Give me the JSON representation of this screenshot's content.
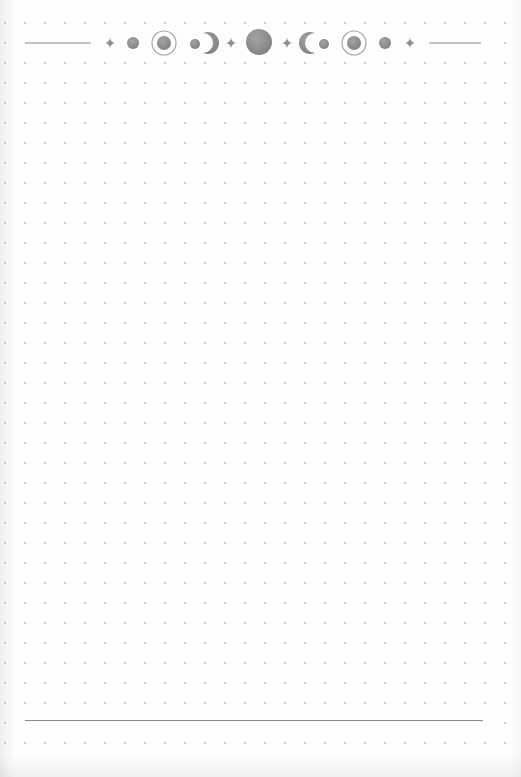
{
  "page": {
    "type": "dot-grid-journal-page",
    "background": "#fdfdfc",
    "dot_color": "#b8b8b8",
    "line_color": "#8a8a8a",
    "icon_color": "#8f8f8f",
    "grid": {
      "spacing_px": 20,
      "origin_x": 5,
      "origin_y": 3,
      "columns": 26,
      "rows": 38
    }
  },
  "header": {
    "line_left": {
      "x1": 25,
      "x2": 91,
      "y": 43
    },
    "line_right": {
      "x1": 429,
      "x2": 481,
      "y": 43
    },
    "icons": [
      {
        "name": "sparkle-icon",
        "x": 110,
        "y": 43,
        "size": 5
      },
      {
        "name": "new-moon-small-icon",
        "x": 133,
        "y": 43,
        "r": 6
      },
      {
        "name": "ringed-moon-icon",
        "x": 164,
        "y": 43,
        "r": 7,
        "ring_r": 12
      },
      {
        "name": "waxing-moon-dot-icon",
        "x": 195,
        "y": 44,
        "r": 5
      },
      {
        "name": "waxing-crescent-icon",
        "x": 208,
        "y": 43,
        "r": 11,
        "direction": "right"
      },
      {
        "name": "sparkle-icon",
        "x": 231,
        "y": 43,
        "size": 5
      },
      {
        "name": "full-moon-icon",
        "x": 259,
        "y": 42,
        "r": 13
      },
      {
        "name": "sparkle-icon",
        "x": 287,
        "y": 43,
        "size": 5
      },
      {
        "name": "waning-crescent-icon",
        "x": 310,
        "y": 43,
        "r": 11,
        "direction": "left"
      },
      {
        "name": "waning-moon-dot-icon",
        "x": 324,
        "y": 44,
        "r": 5
      },
      {
        "name": "ringed-moon-icon",
        "x": 354,
        "y": 43,
        "r": 7,
        "ring_r": 12
      },
      {
        "name": "new-moon-small-icon",
        "x": 385,
        "y": 43,
        "r": 6
      },
      {
        "name": "sparkle-icon",
        "x": 410,
        "y": 43,
        "size": 5
      }
    ]
  },
  "footer": {
    "line": {
      "x1": 25,
      "x2": 483,
      "y": 720
    }
  }
}
